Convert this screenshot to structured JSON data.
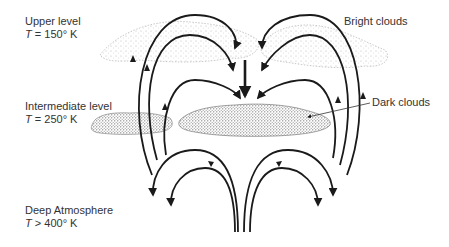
{
  "levels": {
    "upper": {
      "name": "Upper level",
      "temp_var": "T",
      "temp_rel": "=",
      "temp_value": "150° K"
    },
    "intermediate": {
      "name": "Intermediate level",
      "temp_var": "T",
      "temp_rel": "=",
      "temp_value": "250° K"
    },
    "deep": {
      "name": "Deep Atmosphere",
      "temp_var": "T",
      "temp_rel": ">",
      "temp_value": "400° K"
    }
  },
  "annotations": {
    "bright_clouds": "Bright clouds",
    "dark_clouds": "Dark clouds"
  },
  "colors": {
    "line": "#1a1a1a",
    "text": "#333333",
    "bright_cloud": "#b8b8b8",
    "dark_cloud": "#555555"
  }
}
